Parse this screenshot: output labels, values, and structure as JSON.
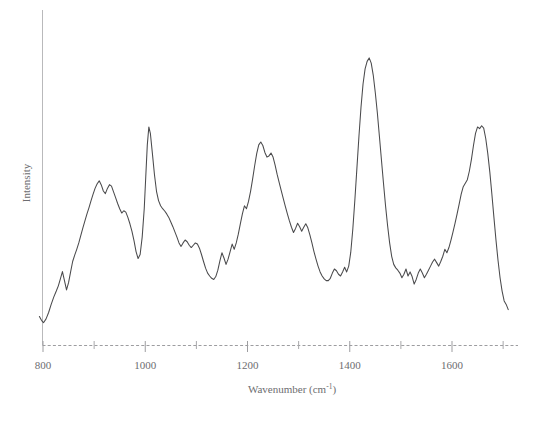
{
  "chart_data": {
    "type": "line",
    "title": "",
    "xlabel": "Wavenumber (cm",
    "xlabel_sup": "-1",
    "xlabel_tail": ")",
    "ylabel": "Intensity",
    "xlim": [
      790,
      1712
    ],
    "ylim": [
      0,
      1
    ],
    "grid": false,
    "legend": false,
    "line_color": "#4a4a4c",
    "axis_color": "#9d9da0",
    "background": "#ffffff",
    "xticks": [
      800,
      1000,
      1200,
      1400,
      1600
    ],
    "xtick_labels": [
      "800",
      "1000",
      "1200",
      "1400",
      "1600"
    ],
    "xtick_minor": [
      900,
      1100,
      1300,
      1500,
      1700
    ],
    "yticks": [],
    "ytick_labels": [],
    "series": [
      {
        "name": "Raman spectrum",
        "x": [
          793,
          797,
          801,
          806,
          811,
          816,
          821,
          826,
          830,
          834,
          838,
          842,
          846,
          850,
          854,
          858,
          862,
          866,
          870,
          874,
          878,
          882,
          886,
          890,
          894,
          898,
          902,
          906,
          910,
          914,
          918,
          922,
          926,
          930,
          934,
          938,
          942,
          946,
          950,
          954,
          958,
          962,
          966,
          970,
          974,
          978,
          982,
          986,
          990,
          994,
          998,
          1001,
          1004,
          1007,
          1010,
          1014,
          1018,
          1022,
          1026,
          1030,
          1034,
          1038,
          1042,
          1046,
          1050,
          1054,
          1058,
          1062,
          1066,
          1070,
          1074,
          1078,
          1082,
          1086,
          1090,
          1094,
          1098,
          1102,
          1106,
          1110,
          1114,
          1118,
          1122,
          1126,
          1130,
          1134,
          1138,
          1142,
          1146,
          1150,
          1154,
          1158,
          1162,
          1166,
          1170,
          1174,
          1178,
          1182,
          1186,
          1190,
          1194,
          1198,
          1202,
          1206,
          1210,
          1214,
          1218,
          1222,
          1226,
          1230,
          1234,
          1238,
          1242,
          1246,
          1250,
          1254,
          1258,
          1262,
          1266,
          1270,
          1274,
          1278,
          1282,
          1286,
          1290,
          1294,
          1298,
          1302,
          1306,
          1310,
          1314,
          1318,
          1322,
          1326,
          1330,
          1334,
          1338,
          1342,
          1346,
          1350,
          1354,
          1358,
          1362,
          1366,
          1370,
          1374,
          1378,
          1382,
          1386,
          1390,
          1394,
          1398,
          1402,
          1406,
          1410,
          1414,
          1418,
          1422,
          1426,
          1430,
          1434,
          1438,
          1442,
          1446,
          1450,
          1454,
          1458,
          1462,
          1466,
          1470,
          1474,
          1478,
          1482,
          1486,
          1490,
          1494,
          1498,
          1502,
          1506,
          1510,
          1514,
          1518,
          1522,
          1526,
          1530,
          1534,
          1538,
          1542,
          1546,
          1550,
          1554,
          1558,
          1562,
          1566,
          1570,
          1574,
          1578,
          1582,
          1586,
          1590,
          1594,
          1598,
          1602,
          1606,
          1610,
          1614,
          1618,
          1622,
          1626,
          1630,
          1634,
          1638,
          1642,
          1646,
          1650,
          1654,
          1658,
          1662,
          1666,
          1670,
          1674,
          1678,
          1682,
          1686,
          1690,
          1694,
          1698,
          1702,
          1706,
          1710
        ],
        "y": [
          0.098,
          0.085,
          0.077,
          0.09,
          0.112,
          0.14,
          0.165,
          0.186,
          0.204,
          0.228,
          0.253,
          0.222,
          0.19,
          0.215,
          0.252,
          0.288,
          0.31,
          0.33,
          0.352,
          0.378,
          0.404,
          0.428,
          0.452,
          0.474,
          0.498,
          0.52,
          0.541,
          0.556,
          0.566,
          0.552,
          0.531,
          0.522,
          0.54,
          0.553,
          0.548,
          0.528,
          0.508,
          0.488,
          0.47,
          0.455,
          0.463,
          0.458,
          0.44,
          0.418,
          0.392,
          0.36,
          0.322,
          0.298,
          0.312,
          0.372,
          0.47,
          0.58,
          0.69,
          0.752,
          0.73,
          0.66,
          0.588,
          0.53,
          0.498,
          0.48,
          0.47,
          0.462,
          0.452,
          0.44,
          0.424,
          0.408,
          0.39,
          0.372,
          0.352,
          0.34,
          0.352,
          0.362,
          0.356,
          0.344,
          0.336,
          0.344,
          0.352,
          0.348,
          0.334,
          0.312,
          0.288,
          0.265,
          0.248,
          0.238,
          0.23,
          0.226,
          0.236,
          0.258,
          0.29,
          0.318,
          0.3,
          0.278,
          0.296,
          0.322,
          0.348,
          0.33,
          0.352,
          0.382,
          0.418,
          0.452,
          0.48,
          0.47,
          0.495,
          0.53,
          0.572,
          0.618,
          0.66,
          0.69,
          0.7,
          0.688,
          0.664,
          0.648,
          0.652,
          0.662,
          0.648,
          0.62,
          0.588,
          0.56,
          0.532,
          0.505,
          0.478,
          0.452,
          0.428,
          0.406,
          0.388,
          0.402,
          0.42,
          0.408,
          0.392,
          0.406,
          0.418,
          0.404,
          0.38,
          0.352,
          0.322,
          0.296,
          0.272,
          0.252,
          0.238,
          0.228,
          0.222,
          0.222,
          0.23,
          0.248,
          0.262,
          0.256,
          0.244,
          0.238,
          0.252,
          0.268,
          0.252,
          0.272,
          0.32,
          0.4,
          0.5,
          0.61,
          0.72,
          0.82,
          0.9,
          0.952,
          0.978,
          0.99,
          0.972,
          0.93,
          0.87,
          0.8,
          0.72,
          0.638,
          0.558,
          0.48,
          0.412,
          0.352,
          0.306,
          0.278,
          0.266,
          0.258,
          0.248,
          0.232,
          0.244,
          0.262,
          0.238,
          0.252,
          0.236,
          0.21,
          0.226,
          0.248,
          0.262,
          0.248,
          0.232,
          0.244,
          0.258,
          0.272,
          0.286,
          0.296,
          0.284,
          0.272,
          0.288,
          0.306,
          0.33,
          0.318,
          0.336,
          0.362,
          0.39,
          0.42,
          0.452,
          0.486,
          0.52,
          0.546,
          0.558,
          0.57,
          0.6,
          0.64,
          0.688,
          0.73,
          0.752,
          0.746,
          0.756,
          0.748,
          0.712,
          0.66,
          0.596,
          0.52,
          0.44,
          0.362,
          0.292,
          0.232,
          0.186,
          0.152,
          0.14,
          0.122
        ]
      }
    ]
  },
  "axes": {
    "y_axis_name": "Intensity",
    "x_axis_name": "Wavenumber (cm-1)"
  }
}
